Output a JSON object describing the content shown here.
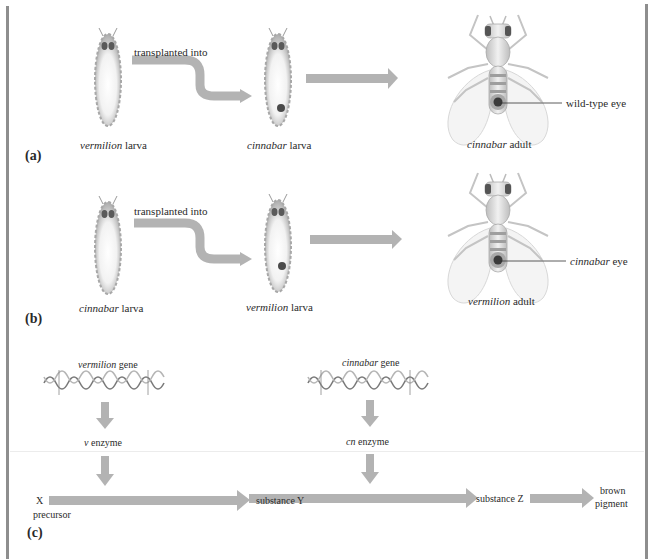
{
  "panels": {
    "a": {
      "label": "(a)",
      "transplant_label": "transplanted into",
      "donor": {
        "italic": "vermilion",
        "rest": " larva"
      },
      "host": {
        "italic": "cinnabar",
        "rest": " larva"
      },
      "adult": {
        "italic": "cinnabar",
        "rest": " adult"
      },
      "eye_callout": "wild-type eye",
      "eye_callout_italic": false
    },
    "b": {
      "label": "(b)",
      "transplant_label": "transplanted into",
      "donor": {
        "italic": "cinnabar",
        "rest": " larva"
      },
      "host": {
        "italic": "vermilion",
        "rest": " larva"
      },
      "adult": {
        "italic": "vermilion",
        "rest": " adult"
      },
      "eye_callout_italic_part": "cinnabar",
      "eye_callout_rest": " eye"
    },
    "c": {
      "label": "(c)",
      "genes": [
        {
          "italic": "vermilion",
          "rest": " gene",
          "enzyme_italic": "v",
          "enzyme_rest": " enzyme"
        },
        {
          "italic": "cinnabar",
          "rest": " gene",
          "enzyme_italic": "cn",
          "enzyme_rest": " enzyme"
        }
      ],
      "pathway": {
        "start_top": "X",
        "start_bottom": "precursor",
        "mid1": "substance Y",
        "mid2": "substance Z",
        "end_top": "brown",
        "end_bottom": "pigment"
      }
    }
  },
  "colors": {
    "arrow": "#b3b3b3",
    "frame": "#8e8e8e",
    "larva_body": "#d9d9d9",
    "eye": "#555555",
    "disc": "#4a4a4a"
  }
}
